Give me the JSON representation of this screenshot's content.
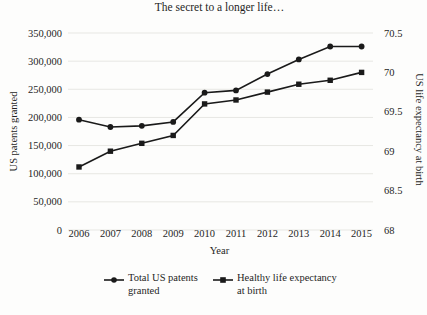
{
  "colors": {
    "series": "#1a1a1a",
    "gridline": "#e7e7e3",
    "text": "#1f1f1f",
    "background": "#fdfdfc"
  },
  "chart_data": {
    "type": "line",
    "title": "The secret to a longer life…",
    "xlabel": "Year",
    "grid": true,
    "legend_position": "bottom",
    "x": [
      2006,
      2007,
      2008,
      2009,
      2010,
      2011,
      2012,
      2013,
      2014,
      2015
    ],
    "x_tick_labels": [
      "2006",
      "2007",
      "2008",
      "2009",
      "2010",
      "2011",
      "2012",
      "2013",
      "2014",
      "2015"
    ],
    "left_axis": {
      "label": "US patents granted",
      "min": 0,
      "max": 350000,
      "tick_values": [
        0,
        50000,
        100000,
        150000,
        200000,
        250000,
        300000,
        350000
      ],
      "tick_labels": [
        "0",
        "50,000",
        "100,000",
        "150,000",
        "200,000",
        "250,000",
        "300,000",
        "350,000"
      ]
    },
    "right_axis": {
      "label": "US life expectancy at birth",
      "min": 68,
      "max": 70.5,
      "tick_values": [
        68,
        68.5,
        69,
        69.5,
        70,
        70.5
      ],
      "tick_labels": [
        "68",
        "68.5",
        "69",
        "69.5",
        "70",
        "70.5"
      ]
    },
    "series": [
      {
        "name": "Total US patents granted",
        "legend_label": "Total US patents\ngranted",
        "axis": "left",
        "marker": "circle",
        "values": [
          196000,
          183000,
          185000,
          192000,
          244000,
          248000,
          277000,
          303000,
          326000,
          326000
        ]
      },
      {
        "name": "Healthy life expectancy at birth",
        "legend_label": "Healthy life expectancy\nat birth",
        "axis": "right",
        "marker": "square",
        "values": [
          68.8,
          69.0,
          69.1,
          69.2,
          69.6,
          69.65,
          69.75,
          69.85,
          69.9,
          70.0
        ]
      }
    ]
  }
}
